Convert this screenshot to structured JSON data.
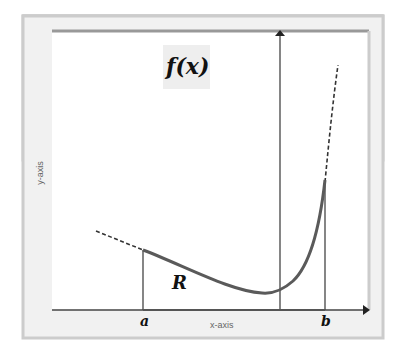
{
  "diagram": {
    "function_label": "f(x)",
    "region_label": "R",
    "lower_bound_label": "a",
    "upper_bound_label": "b",
    "x_axis_label": "x-axis",
    "y_axis_label": "y-axis",
    "colors": {
      "frame": "#d4d4d4",
      "frame_fill": "#f1f1f1",
      "plot_bg": "#ffffff",
      "curve": "#555555",
      "axis": "#333333",
      "label_bg": "#eeeeee"
    }
  }
}
